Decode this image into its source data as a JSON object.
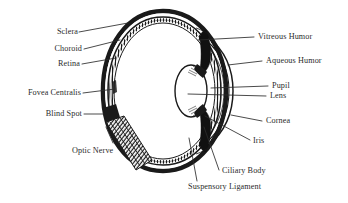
{
  "diagram": {
    "type": "anatomical-cross-section",
    "background_color": "#ffffff",
    "ink_color": "#1a1a1a",
    "text_color": "#2b2b2b",
    "labels": {
      "sclera": "Sclera",
      "choroid": "Choroid",
      "retina": "Retina",
      "fovea_centralis": "Fovea Centralis",
      "blind_spot": "Blind Spot",
      "optic_nerve": "Optic Nerve",
      "vitreous_humor": "Vitreous Humor",
      "aqueous_humor": "Aqueous Humor",
      "pupil": "Pupil",
      "lens": "Lens",
      "cornea": "Cornea",
      "iris": "Iris",
      "ciliary_body": "Ciliary Body",
      "suspensory_ligament": "Suspensory Ligament"
    }
  }
}
